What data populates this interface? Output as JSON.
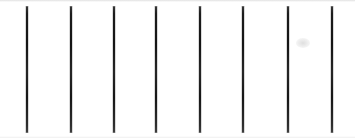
{
  "figure": {
    "canvas": {
      "width": 355,
      "height": 138,
      "background_color": "#ffffff"
    },
    "line_style": {
      "color": "#1a1a1a",
      "edge_color": "#787878",
      "thickness_px": 2,
      "orientation": "vertical",
      "count": 8,
      "spacing_px": 43.5,
      "top_y": 6,
      "bottom_y": 133,
      "length_px": 127
    },
    "lines": [
      {
        "id": "line-1",
        "index": 1,
        "x": 26,
        "top": 6,
        "height": 127
      },
      {
        "id": "line-2",
        "index": 2,
        "x": 70,
        "top": 6,
        "height": 127
      },
      {
        "id": "line-3",
        "index": 3,
        "x": 113,
        "top": 6,
        "height": 127
      },
      {
        "id": "line-4",
        "index": 4,
        "x": 155,
        "top": 6,
        "height": 127
      },
      {
        "id": "line-5",
        "index": 5,
        "x": 199,
        "top": 6,
        "height": 127
      },
      {
        "id": "line-6",
        "index": 6,
        "x": 242,
        "top": 6,
        "height": 127
      },
      {
        "id": "line-7",
        "index": 7,
        "x": 287,
        "top": 6,
        "height": 127
      },
      {
        "id": "line-8",
        "index": 8,
        "x": 331,
        "top": 6,
        "height": 127
      }
    ],
    "artifacts": [
      {
        "id": "smudge-1",
        "x": 296,
        "y": 38,
        "kind": "faint-gray-smudge"
      }
    ]
  }
}
